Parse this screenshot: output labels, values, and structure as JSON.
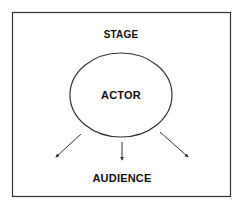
{
  "diagram": {
    "frame_label": "STAGE",
    "center_label": "ACTOR",
    "target_label": "AUDIENCE",
    "arrows": 3
  }
}
